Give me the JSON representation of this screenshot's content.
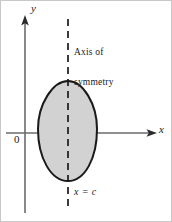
{
  "figure": {
    "background_color": "#ffffff"
  },
  "axes": {
    "y_label": "y",
    "x_label": "x",
    "origin_label": "0",
    "axis_color": "#6b6b6b",
    "x_axis_y": 132,
    "y_axis_x": 24,
    "x_axis_start": 5,
    "x_axis_end": 155,
    "y_axis_top": 18,
    "y_axis_bottom": 212
  },
  "annotations": {
    "symmetry_line_1": "Axis of",
    "symmetry_line_2": "symmetry",
    "equation": "x = c"
  },
  "dashed_line": {
    "name": "axis-of-symmetry-line",
    "x": 67,
    "y_top": 18,
    "y_bottom": 205,
    "color": "#1a1a1a",
    "dash_pattern": "7 5"
  },
  "region": {
    "name": "shaded-egg-region",
    "fill_color": "#d2d2d2",
    "stroke_color": "#1a1a1a",
    "stroke_width": 2,
    "apex_top": [
      67,
      80
    ],
    "left_extreme": [
      37,
      132
    ],
    "right_extreme": [
      96,
      132
    ],
    "bottom": [
      67,
      180
    ]
  }
}
